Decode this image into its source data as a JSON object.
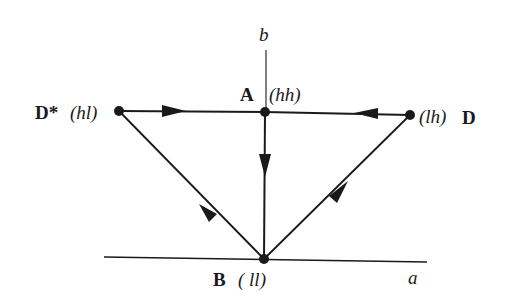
{
  "diagram": {
    "axes": {
      "vertical": {
        "label": "b"
      },
      "horizontal": {
        "label": "a"
      }
    },
    "nodes": [
      {
        "id": "D*",
        "name": "D*",
        "state": "(hl)"
      },
      {
        "id": "A",
        "name": "A",
        "state": "(hh)"
      },
      {
        "id": "D",
        "name": "D",
        "state": "(lh)"
      },
      {
        "id": "B",
        "name": "B",
        "state": "( ll)"
      }
    ],
    "edges": [
      {
        "from": "D*",
        "to": "A"
      },
      {
        "from": "D",
        "to": "A"
      },
      {
        "from": "A",
        "to": "B"
      },
      {
        "from": "B",
        "to": "D*"
      },
      {
        "from": "B",
        "to": "D"
      }
    ],
    "colors": {
      "ink": "#1a1a1a",
      "background": "#ffffff"
    }
  }
}
